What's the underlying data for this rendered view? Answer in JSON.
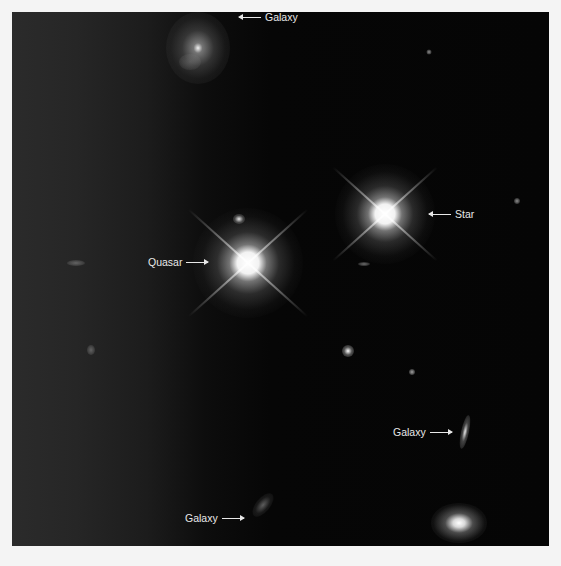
{
  "image": {
    "description": "Space telescope image of a field containing a quasar, a foreground star, and several galaxies",
    "background_color": "#050505",
    "frame_color": "#f4f4f4"
  },
  "annotations": [
    {
      "id": "galaxy-top",
      "text": "Galaxy",
      "arrow": "left"
    },
    {
      "id": "star",
      "text": "Star",
      "arrow": "left"
    },
    {
      "id": "quasar",
      "text": "Quasar",
      "arrow": "right"
    },
    {
      "id": "galaxy-right",
      "text": "Galaxy",
      "arrow": "right"
    },
    {
      "id": "galaxy-bottom",
      "text": "Galaxy",
      "arrow": "right"
    }
  ]
}
